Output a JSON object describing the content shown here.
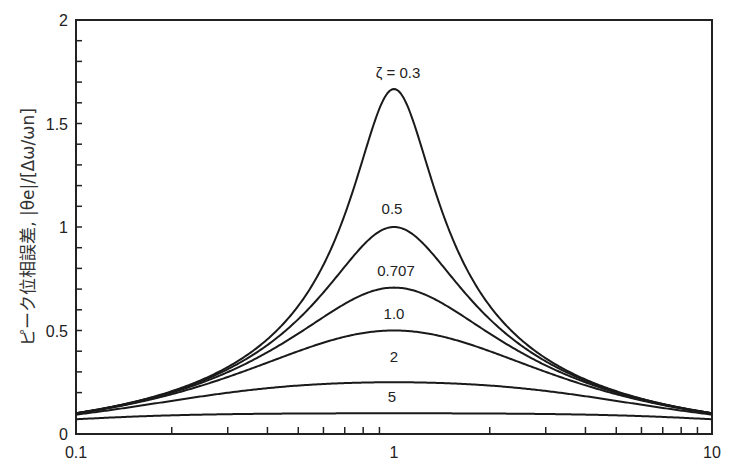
{
  "chart_data": {
    "type": "line",
    "title": "",
    "xlabel": "",
    "ylabel": "ピーク位相誤差, |θe|/[Δω/ωn]",
    "xscale": "log",
    "xlim": [
      0.1,
      10
    ],
    "ylim": [
      0,
      2
    ],
    "grid": false,
    "legend": "inline labels above curve peaks",
    "x_ticks": [
      "0.1",
      "1",
      "10"
    ],
    "y_ticks": [
      "0",
      "0.5",
      "1",
      "1.5",
      "2"
    ],
    "x": [
      0.1,
      0.2,
      0.3,
      0.5,
      0.7,
      1.0,
      1.5,
      2,
      3,
      5,
      10
    ],
    "series": [
      {
        "name": "ζ = 0.3",
        "label": "ζ = 0.3",
        "peak": 1.67,
        "values": [
          0.1,
          0.21,
          0.33,
          0.62,
          1.08,
          1.67,
          0.84,
          0.61,
          0.36,
          0.2,
          0.1
        ]
      },
      {
        "name": "0.5",
        "label": "0.5",
        "peak": 1.0,
        "values": [
          0.1,
          0.21,
          0.32,
          0.55,
          0.8,
          1.0,
          0.77,
          0.58,
          0.35,
          0.2,
          0.1
        ]
      },
      {
        "name": "0.707",
        "label": "0.707",
        "peak": 0.707,
        "values": [
          0.1,
          0.2,
          0.3,
          0.49,
          0.63,
          0.71,
          0.63,
          0.49,
          0.32,
          0.19,
          0.1
        ]
      },
      {
        "name": "1.0",
        "label": "1.0",
        "peak": 0.5,
        "values": [
          0.1,
          0.19,
          0.28,
          0.4,
          0.47,
          0.5,
          0.46,
          0.4,
          0.3,
          0.19,
          0.1
        ]
      },
      {
        "name": "2",
        "label": "2",
        "peak": 0.25,
        "values": [
          0.09,
          0.15,
          0.19,
          0.23,
          0.25,
          0.25,
          0.24,
          0.22,
          0.17,
          0.12,
          0.08
        ]
      },
      {
        "name": "5",
        "label": "5",
        "peak": 0.1,
        "values": [
          0.07,
          0.08,
          0.09,
          0.1,
          0.1,
          0.1,
          0.1,
          0.09,
          0.09,
          0.08,
          0.05
        ]
      }
    ],
    "formula": "x / sqrt((1 - x^2)^2 + (2 ζ x)^2)"
  },
  "axis": {
    "y_label_jp": "ピーク位相誤差,",
    "y_label_math": "|θe|/[Δω/ωn]"
  }
}
